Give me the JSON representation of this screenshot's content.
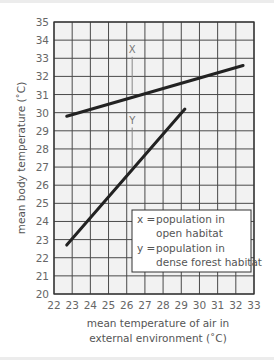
{
  "chart_data": {
    "type": "line",
    "title": "",
    "xlabel": "mean temperature of air in external environment (°C)",
    "xlabel_lines": [
      "mean temperature of air in",
      "external environment (˚C)"
    ],
    "ylabel": "mean body temperature (˚C)",
    "xlim": [
      22,
      33
    ],
    "ylim": [
      20,
      35
    ],
    "x_ticks": [
      22,
      23,
      24,
      25,
      26,
      27,
      28,
      29,
      30,
      31,
      32,
      33
    ],
    "y_ticks": [
      20,
      21,
      22,
      23,
      24,
      25,
      26,
      27,
      28,
      29,
      30,
      31,
      32,
      33,
      34,
      35
    ],
    "grid": true,
    "series": [
      {
        "name": "X",
        "description": "population in open habitat",
        "x": [
          22.7,
          32.4
        ],
        "y": [
          29.8,
          32.6
        ]
      },
      {
        "name": "Y",
        "description": "population in dense forest habitat",
        "x": [
          22.7,
          29.2
        ],
        "y": [
          22.7,
          30.2
        ]
      }
    ],
    "series_labels": [
      {
        "text": "X",
        "x": 26.3,
        "y": 33.3
      },
      {
        "text": "Y",
        "x": 26.3,
        "y": 29.4
      }
    ],
    "legend": {
      "position": "lower right",
      "entries": [
        {
          "key": "x =",
          "line1": "population in",
          "line2": "open habitat"
        },
        {
          "key": "y =",
          "line1": "population in",
          "line2": "dense forest habitat"
        }
      ]
    }
  },
  "colors": {
    "grid": "#4a4a4a",
    "plot_bg": "#f2f2f2",
    "line": "#222222",
    "pointer": "#888888"
  }
}
